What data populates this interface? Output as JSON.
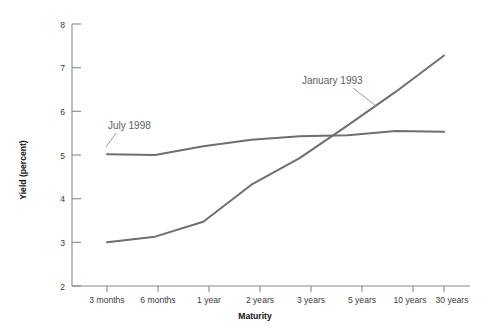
{
  "chart_data": {
    "type": "line",
    "title": "",
    "xlabel": "Maturity",
    "ylabel": "Yield (percent)",
    "categories": [
      "3 months",
      "6 months",
      "1 year",
      "2 years",
      "3 years",
      "5 years",
      "10 years",
      "30 years"
    ],
    "ylim": [
      2,
      8
    ],
    "yticks": [
      2,
      3,
      4,
      5,
      6,
      7,
      8
    ],
    "ytick_labels": [
      "2",
      "3",
      "4",
      "5",
      "6",
      "7",
      "8"
    ],
    "grid": false,
    "legend": "inline-annotations",
    "line_color": "#6f6f6f",
    "axis_color": "#8a8a8a",
    "background": "#ffffff",
    "series": [
      {
        "name": "July 1998",
        "values": [
          5.02,
          5.0,
          5.2,
          5.35,
          5.43,
          5.45,
          5.55,
          5.53
        ]
      },
      {
        "name": "January 1993",
        "values": [
          3.0,
          3.13,
          3.47,
          4.32,
          4.93,
          5.68,
          6.45,
          7.28
        ]
      }
    ],
    "annotations": [
      {
        "text": "July 1998",
        "series": "July 1998",
        "label_x": 108,
        "label_y": 129,
        "leader_from_x": 116,
        "leader_from_y": 133,
        "leader_to_x": 106,
        "leader_to_y": 147
      },
      {
        "text": "January 1993",
        "series": "January 1993",
        "label_x": 302,
        "label_y": 84,
        "leader_from_x": 353,
        "leader_from_y": 88,
        "leader_to_x": 374,
        "leader_to_y": 104
      }
    ]
  }
}
